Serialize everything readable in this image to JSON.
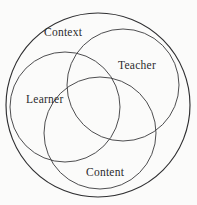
{
  "diagram": {
    "type": "venn-three-circle-with-enclosing-circle",
    "background_color": "#fbfbfa",
    "stroke_color": "#3a3a3c",
    "outer_stroke_color": "#2f2f31",
    "label_color": "#2b2b2d",
    "canvas": {
      "width": 197,
      "height": 205
    },
    "outer_circle": {
      "name": "enclosing-circle",
      "cx": 98,
      "cy": 105,
      "r": 92
    },
    "circles": [
      {
        "id": "learner",
        "label": "Learner",
        "cx": 65,
        "cy": 107,
        "r": 55,
        "label_x": 26,
        "label_y": 94
      },
      {
        "id": "teacher",
        "label": "Teacher",
        "cx": 123,
        "cy": 85,
        "r": 56,
        "label_x": 118,
        "label_y": 60
      },
      {
        "id": "content",
        "label": "Content",
        "cx": 100,
        "cy": 133,
        "r": 56,
        "label_x": 86,
        "label_y": 167
      }
    ],
    "context_label": {
      "id": "context",
      "label": "Context",
      "label_x": 44,
      "label_y": 27
    }
  }
}
